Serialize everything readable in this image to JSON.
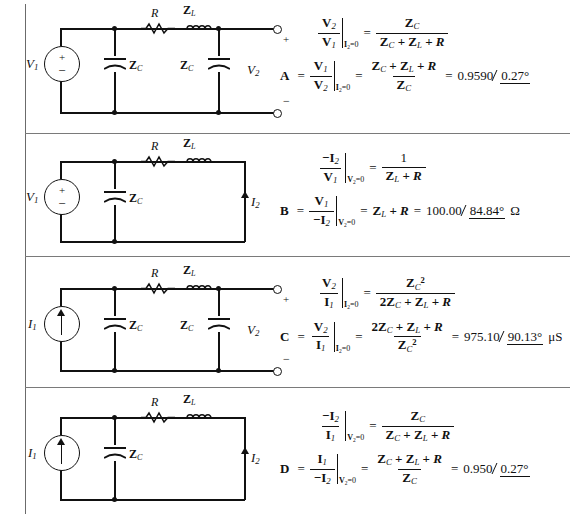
{
  "figure": {
    "type": "two-port-parameter-table",
    "row_count": 4,
    "columns": [
      "circuit",
      "equations"
    ]
  },
  "symbols": {
    "R": "R",
    "ZL": "Z",
    "ZL_sub": "L",
    "ZC": "Z",
    "ZC_sub": "C",
    "V1": "V",
    "V1_sub": "1",
    "V2": "V",
    "V2_sub": "2",
    "I1": "I",
    "I1_sub": "1",
    "I2": "I",
    "I2_sub": "2",
    "plus": "+",
    "minus": "−",
    "ohm": "Ω",
    "micro_siemens": "μS",
    "degree": "°"
  },
  "rows": [
    {
      "id": "row-a",
      "parameter": "A",
      "circuit": {
        "source_type": "voltage-source",
        "source_label": "V",
        "source_sub": "1",
        "series_elements": [
          "R",
          "ZL"
        ],
        "shunt_elements": [
          "ZC",
          "ZC"
        ],
        "output": "open-terminals",
        "terminal_plus": "+",
        "terminal_minus": "−",
        "output_label": "V",
        "output_label_sub": "2"
      },
      "eq1": {
        "num": "V",
        "num_sub": "2",
        "den": "V",
        "den_sub": "1",
        "condition_var": "I",
        "condition_sub": "2",
        "condition_val": "=0",
        "rhs_num": "Z_C",
        "rhs_den": "Z_C + Z_L + R"
      },
      "eq2": {
        "lead": "A",
        "num": "V",
        "num_sub": "1",
        "den": "V",
        "den_sub": "2",
        "condition_var": "I",
        "condition_sub": "2",
        "condition_val": "=0",
        "rhs_num": "Z_C + Z_L + R",
        "rhs_den": "Z_C",
        "result": "0.9590",
        "result_angle": "0.27°",
        "result_unit": ""
      }
    },
    {
      "id": "row-b",
      "parameter": "B",
      "circuit": {
        "source_type": "voltage-source",
        "source_label": "V",
        "source_sub": "1",
        "series_elements": [
          "R",
          "ZL"
        ],
        "shunt_elements": [
          "ZC"
        ],
        "output": "short-circuit",
        "output_label": "I",
        "output_label_sub": "2"
      },
      "eq1": {
        "num": "−I",
        "num_sub": "2",
        "den": "V",
        "den_sub": "1",
        "condition_var": "V",
        "condition_sub": "2",
        "condition_val": "=0",
        "rhs_num": "1",
        "rhs_den": "Z_L + R"
      },
      "eq2": {
        "lead": "B",
        "num": "V",
        "num_sub": "1",
        "den": "−I",
        "den_sub": "2",
        "condition_var": "V",
        "condition_sub": "2",
        "condition_val": "=0",
        "rhs_plain": "Z_L + R",
        "result": "100.00",
        "result_angle": "84.84°",
        "result_unit": "Ω"
      }
    },
    {
      "id": "row-c",
      "parameter": "C",
      "circuit": {
        "source_type": "current-source",
        "source_label": "I",
        "source_sub": "1",
        "series_elements": [
          "R",
          "ZL"
        ],
        "shunt_elements": [
          "ZC",
          "ZC"
        ],
        "output": "open-terminals",
        "terminal_plus": "+",
        "terminal_minus": "−",
        "output_label": "V",
        "output_label_sub": "2"
      },
      "eq1": {
        "num": "V",
        "num_sub": "2",
        "den": "I",
        "den_sub": "1",
        "condition_var": "I",
        "condition_sub": "2",
        "condition_val": "=0",
        "rhs_num": "Z_C²",
        "rhs_den": "2Z_C + Z_L + R"
      },
      "eq2": {
        "lead": "C",
        "num": "V",
        "num_sub": "2",
        "den": "I",
        "den_sub": "1",
        "condition_var": "I",
        "condition_sub": "2",
        "condition_val": "=0",
        "rhs_num": "2Z_C + Z_L + R",
        "rhs_den": "Z_C²",
        "result": "975.10",
        "result_angle": "90.13°",
        "result_unit": "μS"
      }
    },
    {
      "id": "row-d",
      "parameter": "D",
      "circuit": {
        "source_type": "current-source",
        "source_label": "I",
        "source_sub": "1",
        "series_elements": [
          "R",
          "ZL"
        ],
        "shunt_elements": [
          "ZC"
        ],
        "output": "short-circuit",
        "output_label": "I",
        "output_label_sub": "2"
      },
      "eq1": {
        "num": "−I",
        "num_sub": "2",
        "den": "I",
        "den_sub": "1",
        "condition_var": "V",
        "condition_sub": "2",
        "condition_val": "=0",
        "rhs_num": "Z_C",
        "rhs_den": "Z_C + Z_L + R"
      },
      "eq2": {
        "lead": "D",
        "num": "I",
        "num_sub": "1",
        "den": "−I",
        "den_sub": "2",
        "condition_var": "V",
        "condition_sub": "2",
        "condition_val": "=0",
        "rhs_num": "Z_C + Z_L + R",
        "rhs_den": "Z_C",
        "result": "0.950",
        "result_angle": "0.27°",
        "result_unit": ""
      }
    }
  ],
  "colors": {
    "ink": "#111111",
    "rule": "#7a7a7a",
    "background": "#ffffff"
  }
}
